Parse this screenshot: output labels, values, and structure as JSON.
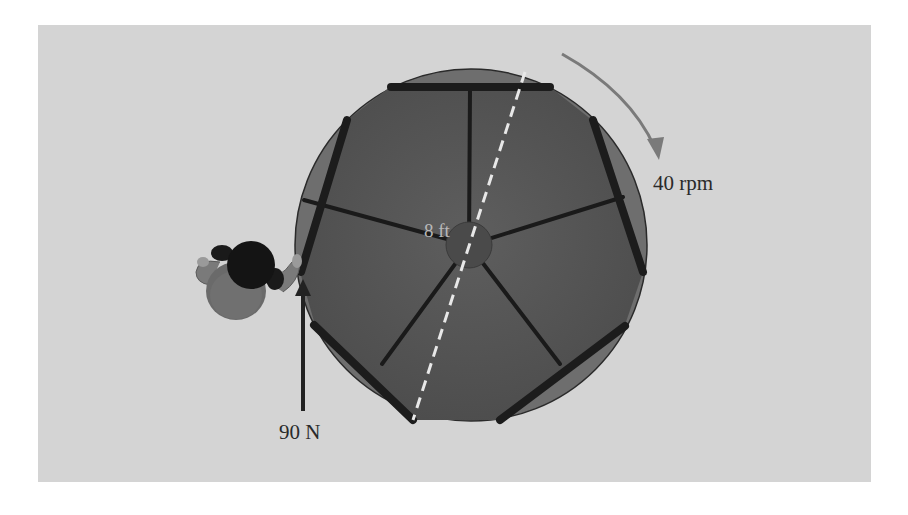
{
  "figure": {
    "labels": {
      "rotation_rate": "40 rpm",
      "diameter": "8 ft",
      "applied_force": "90 N"
    },
    "colors": {
      "panel_background": "#d4d4d4",
      "disc_rim": "#6e6e6e",
      "disc_platform": "#5a5a5a",
      "bars": "#1e1e1e",
      "hub": "#4a4a4a",
      "rotation_arrow": "#7a7a7a",
      "force_arrow": "#222222",
      "diameter_dash": "#e8e8e8"
    }
  }
}
